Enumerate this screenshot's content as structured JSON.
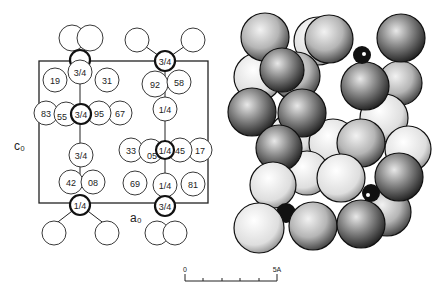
{
  "figure": {
    "left_panel": {
      "description": "Unit cell projection with atom heights",
      "axis_labels": {
        "vertical": "c₀",
        "horizontal": "a₀"
      },
      "atom_labels": [
        "19",
        "3/4",
        "31",
        "83",
        "55",
        "3/4",
        "95",
        "67",
        "92",
        "58",
        "1/4",
        "33",
        "05",
        "1/4",
        "45",
        "17",
        "3/4",
        "42",
        "08",
        "69",
        "1/4",
        "81",
        "1/4",
        "3/4",
        "3/4"
      ]
    },
    "right_panel": {
      "description": "Space-filling sphere packing model"
    },
    "scale_bar": {
      "start_label": "0",
      "end_label": "5A",
      "ticks": 6
    }
  }
}
